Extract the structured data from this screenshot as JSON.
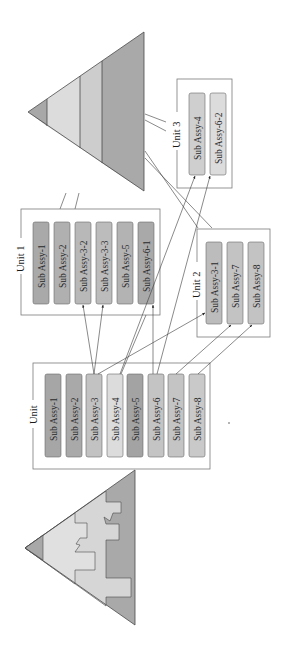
{
  "diagram": {
    "colors": {
      "dark": "#a3a3a3",
      "medium": "#bcbcbc",
      "light": "#cfcfcf",
      "lighter": "#dedede",
      "triangle_tip": "#a8a8a8",
      "triangle_band1": "#dcdcdc",
      "triangle_band2": "#cdcdcd",
      "triangle_band3": "#a9a9a9"
    },
    "source_unit": {
      "label": "Unit",
      "items": [
        "Sub Assy-1",
        "Sub Assy-2",
        "Sub Assy-3",
        "Sub Assy-4",
        "Sub Assy-5",
        "Sub Assy-6",
        "Sub Assy-7",
        "Sub Assy-8"
      ]
    },
    "unit1": {
      "label": "Unit 1",
      "items": [
        "Sub Assy-1",
        "Sub Assy-2",
        "Sub Assy-3-2",
        "Sub Assy-3-3",
        "Sub Assy-5",
        "Sub Assy-6-1"
      ]
    },
    "unit2": {
      "label": "Unit 2",
      "items": [
        "Sub Assy-3-1",
        "Sub Assy-7",
        "Sub Assy-8"
      ]
    },
    "unit3": {
      "label": "Unit 3",
      "items": [
        "Sub Assy-4",
        "Sub Assy-6-2"
      ]
    },
    "connections": [
      {
        "from": "Sub Assy-3",
        "to": "Unit 1 / Sub Assy-3-2"
      },
      {
        "from": "Sub Assy-3",
        "to": "Unit 1 / Sub Assy-3-3"
      },
      {
        "from": "Sub Assy-3",
        "to": "Unit 2 / Sub Assy-3-1"
      },
      {
        "from": "Sub Assy-4",
        "to": "Unit 3 / Sub Assy-4"
      },
      {
        "from": "Sub Assy-6",
        "to": "Unit 1 / Sub Assy-6-1"
      },
      {
        "from": "Sub Assy-6",
        "to": "Unit 3 / Sub Assy-6-2"
      },
      {
        "from": "Sub Assy-7",
        "to": "Unit 2 / Sub Assy-7"
      },
      {
        "from": "Sub Assy-8",
        "to": "Unit 2 / Sub Assy-8"
      }
    ]
  }
}
